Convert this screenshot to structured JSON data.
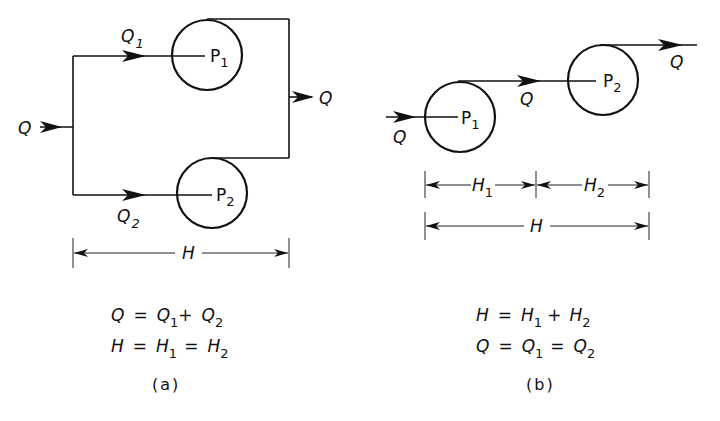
{
  "figure": {
    "panel_a": {
      "caption": "(a)",
      "inflow_label": "Q",
      "outflow_label": "Q",
      "branch_top": {
        "flow_label": "Q",
        "flow_sub": "1",
        "pump_label": "P",
        "pump_sub": "1"
      },
      "branch_bottom": {
        "flow_label": "Q",
        "flow_sub": "2",
        "pump_label": "P",
        "pump_sub": "2"
      },
      "dimension_label": "H",
      "equations": [
        {
          "lhs": "Q",
          "op1": "=",
          "t1": "Q",
          "t1_sub": "1",
          "op2": "+",
          "t2": "Q",
          "t2_sub": "2"
        },
        {
          "lhs": "H",
          "op1": "=",
          "t1": "H",
          "t1_sub": "1",
          "op2": "=",
          "t2": "H",
          "t2_sub": "2"
        }
      ]
    },
    "panel_b": {
      "caption": "(b)",
      "inflow_label": "Q",
      "middle_flow_label": "Q",
      "outflow_label": "Q",
      "pump1": {
        "label": "P",
        "sub": "1"
      },
      "pump2": {
        "label": "P",
        "sub": "2"
      },
      "dim_h1": {
        "label": "H",
        "sub": "1"
      },
      "dim_h2": {
        "label": "H",
        "sub": "2"
      },
      "dimension_label": "H",
      "equations": [
        {
          "lhs": "H",
          "op1": "=",
          "t1": "H",
          "t1_sub": "1",
          "op2": "+",
          "t2": "H",
          "t2_sub": "2"
        },
        {
          "lhs": "Q",
          "op1": "=",
          "t1": "Q",
          "t1_sub": "1",
          "op2": "=",
          "t2": "Q",
          "t2_sub": "2"
        }
      ]
    }
  }
}
